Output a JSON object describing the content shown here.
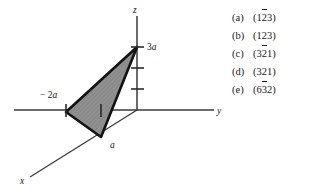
{
  "figure": {
    "type": "crystal-plane-diagram",
    "axes": [
      {
        "name": "x",
        "label": "x",
        "direction": "lower-left"
      },
      {
        "name": "y",
        "label": "y",
        "direction": "right"
      },
      {
        "name": "z",
        "label": "z",
        "direction": "up"
      }
    ],
    "intercepts": [
      {
        "axis": "z",
        "label": "3a",
        "label_number": "3",
        "label_unit": "a",
        "value": 3
      },
      {
        "axis": "y",
        "label": "− 2a",
        "label_number": "− 2",
        "label_unit": "a",
        "value": -2
      },
      {
        "axis": "x",
        "label": "a",
        "label_number": "",
        "label_unit": "a",
        "value": 1
      }
    ],
    "z_axis_ticks": 3,
    "y_axis_ticks": 2,
    "colors": {
      "plane_fill": "#8f8f8f",
      "plane_edge": "#121212",
      "axis_line": "#3a3a3a",
      "background": "#ffffff",
      "text": "#161616"
    }
  },
  "choices": {
    "items": [
      {
        "key": "(a)",
        "open": "(",
        "digits": [
          {
            "text": "1",
            "bar": false
          },
          {
            "text": "2",
            "bar": true
          },
          {
            "text": "3",
            "bar": false
          }
        ],
        "close": ")",
        "plain": "(1̄2̄3)"
      },
      {
        "key": "(b)",
        "open": "(",
        "digits": [
          {
            "text": "1",
            "bar": false
          },
          {
            "text": "2",
            "bar": false
          },
          {
            "text": "3",
            "bar": false
          }
        ],
        "close": ")",
        "plain": "(123)"
      },
      {
        "key": "(c)",
        "open": "(",
        "digits": [
          {
            "text": "3",
            "bar": false
          },
          {
            "text": "2",
            "bar": true
          },
          {
            "text": "1",
            "bar": false
          }
        ],
        "close": ")",
        "plain": "(32̄1)"
      },
      {
        "key": "(d)",
        "open": "(",
        "digits": [
          {
            "text": "3",
            "bar": false
          },
          {
            "text": "2",
            "bar": false
          },
          {
            "text": "1",
            "bar": false
          }
        ],
        "close": ")",
        "plain": "(321)"
      },
      {
        "key": "(e)",
        "open": "(",
        "digits": [
          {
            "text": "6",
            "bar": false
          },
          {
            "text": "3",
            "bar": true
          },
          {
            "text": "2",
            "bar": false
          }
        ],
        "close": ")",
        "plain": "(63̄2)"
      }
    ]
  }
}
